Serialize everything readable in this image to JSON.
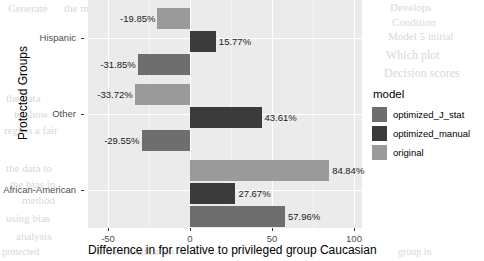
{
  "chart_data": {
    "type": "bar",
    "orientation": "horizontal",
    "title": "",
    "xlabel": "Difference in fpr relative to privileged group Caucasian",
    "ylabel": "Protected Groups",
    "categories": [
      "Hispanic",
      "Other",
      "African-American"
    ],
    "xlim": [
      -62,
      105
    ],
    "xticks": [
      -50,
      0,
      50,
      100
    ],
    "xticklabels": [
      "-50",
      "0",
      "50",
      "100"
    ],
    "grid": true,
    "legend_title": "model",
    "legend_position": "right",
    "series": [
      {
        "name": "original",
        "color": "#9a9a9a",
        "values": [
          -19.85,
          -33.72,
          84.84
        ],
        "labels": [
          "-19.85%",
          "-33.72%",
          "84.84%"
        ]
      },
      {
        "name": "optimized_manual",
        "color": "#3b3b3b",
        "values": [
          15.77,
          43.61,
          27.67
        ],
        "labels": [
          "15.77%",
          "43.61%",
          "27.67%"
        ]
      },
      {
        "name": "optimized_J_stat",
        "color": "#6e6e6e",
        "values": [
          -31.85,
          -29.55,
          57.96
        ],
        "labels": [
          "-31.85%",
          "-29.55%",
          "57.96%"
        ]
      }
    ],
    "legend_entries": [
      {
        "label": "optimized_J_stat",
        "color": "#6e6e6e"
      },
      {
        "label": "optimized_manual",
        "color": "#3b3b3b"
      },
      {
        "label": "original",
        "color": "#9a9a9a"
      }
    ],
    "bars": [
      {
        "group": "Hispanic",
        "model": "original",
        "value": -19.85,
        "label": "-19.85%"
      },
      {
        "group": "Hispanic",
        "model": "optimized_manual",
        "value": 15.77,
        "label": "15.77%"
      },
      {
        "group": "Hispanic",
        "model": "optimized_J_stat",
        "value": -31.85,
        "label": "-31.85%"
      },
      {
        "group": "Other",
        "model": "original",
        "value": -33.72,
        "label": "-33.72%"
      },
      {
        "group": "Other",
        "model": "optimized_manual",
        "value": 43.61,
        "label": "43.61%"
      },
      {
        "group": "Other",
        "model": "optimized_J_stat",
        "value": -29.55,
        "label": "-29.55%"
      },
      {
        "group": "African-American",
        "model": "original",
        "value": 84.84,
        "label": "84.84%"
      },
      {
        "group": "African-American",
        "model": "optimized_manual",
        "value": 27.67,
        "label": "27.67%"
      },
      {
        "group": "African-American",
        "model": "optimized_J_stat",
        "value": 57.96,
        "label": "57.96%"
      }
    ],
    "panel_background": "#ebebeb",
    "gridline_color": "#ffffff"
  },
  "ghost_text": [
    {
      "text": "Generate",
      "x": 8,
      "y": 2,
      "size": 11
    },
    {
      "text": "the model",
      "x": 64,
      "y": 2,
      "size": 11
    },
    {
      "text": "Develops",
      "x": 390,
      "y": 1,
      "size": 11
    },
    {
      "text": "Condition",
      "x": 392,
      "y": 16,
      "size": 11
    },
    {
      "text": "Model 5 initial",
      "x": 388,
      "y": 30,
      "size": 11
    },
    {
      "text": "Which plot",
      "x": 386,
      "y": 48,
      "size": 12
    },
    {
      "text": "Decision scores",
      "x": 384,
      "y": 66,
      "size": 12
    },
    {
      "text": "the data",
      "x": 6,
      "y": 92,
      "size": 11
    },
    {
      "text": "to show",
      "x": 14,
      "y": 108,
      "size": 11
    },
    {
      "text": "region a fair",
      "x": 4,
      "y": 124,
      "size": 11
    },
    {
      "text": "the data to",
      "x": 6,
      "y": 162,
      "size": 11
    },
    {
      "text": "the bias in",
      "x": 10,
      "y": 178,
      "size": 11
    },
    {
      "text": "method",
      "x": 22,
      "y": 194,
      "size": 11
    },
    {
      "text": "using bias",
      "x": 6,
      "y": 212,
      "size": 11
    },
    {
      "text": "analysis",
      "x": 16,
      "y": 230,
      "size": 11
    },
    {
      "text": "protected",
      "x": 2,
      "y": 246,
      "size": 10
    },
    {
      "text": "of the classification",
      "x": 96,
      "y": 246,
      "size": 10
    },
    {
      "text": "group in",
      "x": 398,
      "y": 246,
      "size": 10
    }
  ]
}
